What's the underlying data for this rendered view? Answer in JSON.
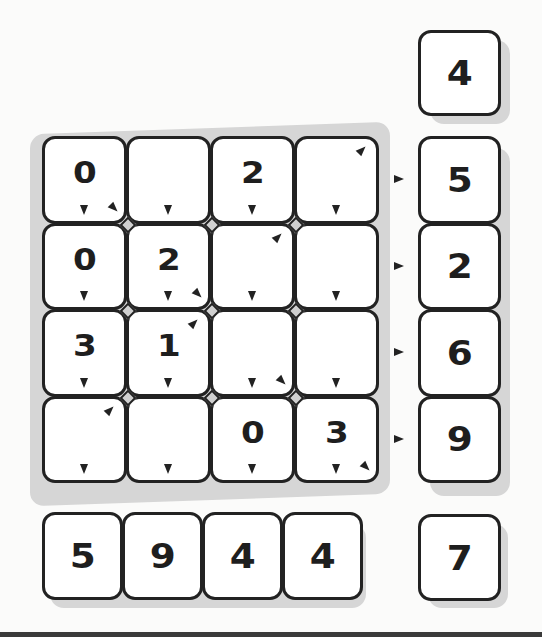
{
  "puzzle": {
    "grid": [
      [
        {
          "value": "0",
          "down": true,
          "diag_br": true,
          "diag_tr": false
        },
        {
          "value": "",
          "down": true,
          "diag_br": false,
          "diag_tr": false
        },
        {
          "value": "2",
          "down": true,
          "diag_br": false,
          "diag_tr": false
        },
        {
          "value": "",
          "down": true,
          "diag_br": false,
          "diag_tr": true
        }
      ],
      [
        {
          "value": "0",
          "down": true,
          "diag_br": false,
          "diag_tr": false
        },
        {
          "value": "2",
          "down": true,
          "diag_br": true,
          "diag_tr": false
        },
        {
          "value": "",
          "down": true,
          "diag_br": false,
          "diag_tr": true
        },
        {
          "value": "",
          "down": true,
          "diag_br": false,
          "diag_tr": false
        }
      ],
      [
        {
          "value": "3",
          "down": true,
          "diag_br": false,
          "diag_tr": false
        },
        {
          "value": "1",
          "down": true,
          "diag_br": false,
          "diag_tr": true
        },
        {
          "value": "",
          "down": true,
          "diag_br": true,
          "diag_tr": false
        },
        {
          "value": "",
          "down": true,
          "diag_br": false,
          "diag_tr": false
        }
      ],
      [
        {
          "value": "",
          "down": true,
          "diag_br": false,
          "diag_tr": true
        },
        {
          "value": "",
          "down": true,
          "diag_br": false,
          "diag_tr": false
        },
        {
          "value": "0",
          "down": true,
          "diag_br": false,
          "diag_tr": false
        },
        {
          "value": "3",
          "down": true,
          "diag_br": true,
          "diag_tr": false
        }
      ]
    ],
    "diagonal_sum_top": "4",
    "row_sums": [
      "5",
      "2",
      "6",
      "9"
    ],
    "column_sums": [
      "5",
      "9",
      "4",
      "4"
    ],
    "diagonal_sum_bottom": "7",
    "colors": {
      "background": "#fbfbfa",
      "tile_border": "#222222",
      "tile_fill": "#ffffff",
      "shadow": "#d6d6d6",
      "text": "#1e1e1e"
    }
  }
}
